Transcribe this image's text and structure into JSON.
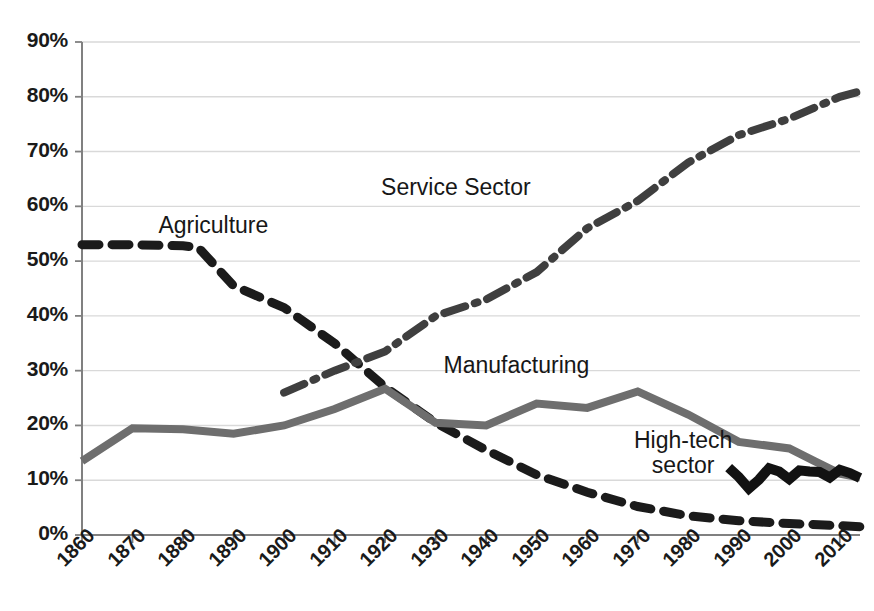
{
  "chart_data": {
    "type": "line",
    "title": "",
    "subtitle": "",
    "xlabel": "",
    "ylabel": "",
    "xlim": [
      1860,
      2014
    ],
    "ylim": [
      0,
      90
    ],
    "grid": true,
    "grid_axis": "y",
    "legend_position": "inline-annotations",
    "y_tick_labels": [
      "90%",
      "80%",
      "70%",
      "60%",
      "50%",
      "40%",
      "30%",
      "20%",
      "10%",
      "0%"
    ],
    "y_tick_values": [
      90,
      80,
      70,
      60,
      50,
      40,
      30,
      20,
      10,
      0
    ],
    "x_tick_labels": [
      "1860",
      "1870",
      "1880",
      "1890",
      "1900",
      "1910",
      "1920",
      "1930",
      "1940",
      "1950",
      "1960",
      "1970",
      "1980",
      "1990",
      "2000",
      "2010"
    ],
    "x_tick_values": [
      1860,
      1870,
      1880,
      1890,
      1900,
      1910,
      1920,
      1930,
      1940,
      1950,
      1960,
      1970,
      1980,
      1990,
      2000,
      2010
    ],
    "series": [
      {
        "name": "Agriculture",
        "label": "Agriculture",
        "color": "#1b1b1b",
        "linestyle": "dashed",
        "linewidth": 9,
        "dasharray": "17 13",
        "annotation_xy": [
          1886,
          56
        ],
        "x": [
          1860,
          1870,
          1880,
          1883,
          1890,
          1900,
          1910,
          1920,
          1930,
          1940,
          1950,
          1960,
          1970,
          1980,
          1990,
          2000,
          2010,
          2014
        ],
        "values": [
          53,
          53,
          52.8,
          52.5,
          45.5,
          41.5,
          35,
          27,
          20.5,
          15.5,
          11,
          7.8,
          5.2,
          3.5,
          2.6,
          2.1,
          1.7,
          1.5
        ]
      },
      {
        "name": "Manufacturing",
        "label": "Manufacturing",
        "color": "#6e6e6e",
        "linestyle": "solid",
        "linewidth": 8,
        "dasharray": "",
        "annotation_xy": [
          1946,
          30.5
        ],
        "x": [
          1860,
          1870,
          1880,
          1890,
          1900,
          1910,
          1920,
          1930,
          1940,
          1950,
          1960,
          1970,
          1980,
          1990,
          2000,
          2005,
          2010,
          2014
        ],
        "values": [
          13.5,
          19.5,
          19.3,
          18.5,
          20,
          23,
          26.7,
          20.5,
          20,
          24,
          23.2,
          26.2,
          22,
          17,
          15.8,
          13.5,
          11.2,
          10.5
        ]
      },
      {
        "name": "Service Sector",
        "label": "Service Sector",
        "color": "#3f3f3f",
        "linestyle": "dashdot",
        "linewidth": 8,
        "dasharray": "22 10 3 10",
        "annotation_xy": [
          1934,
          63
        ],
        "x": [
          1900,
          1910,
          1920,
          1930,
          1940,
          1950,
          1960,
          1970,
          1980,
          1990,
          2000,
          2010,
          2014
        ],
        "values": [
          26,
          30,
          33.5,
          40,
          43,
          48,
          56,
          61,
          68,
          73,
          76,
          80,
          81
        ]
      },
      {
        "name": "High-tech sector",
        "label": "High-tech\nsector",
        "label_line_1": "High-tech",
        "label_line_2": "sector",
        "color": "#121212",
        "linestyle": "solid",
        "linewidth": 10,
        "dasharray": "",
        "annotation_xy": [
          1979,
          14.5
        ],
        "x": [
          1988,
          1990,
          1992,
          1994,
          1996,
          1998,
          2000,
          2002,
          2004,
          2006,
          2008,
          2010,
          2012,
          2014
        ],
        "values": [
          12.3,
          10.6,
          8.5,
          10.1,
          12.2,
          11.6,
          10.2,
          11.8,
          11.6,
          11.5,
          10.5,
          11.9,
          11.3,
          10.4
        ]
      }
    ],
    "annotations": [
      {
        "text": "Agriculture",
        "x": 1886,
        "y": 56
      },
      {
        "text": "Service Sector",
        "x": 1934,
        "y": 63
      },
      {
        "text": "Manufacturing",
        "x": 1946,
        "y": 30.5
      },
      {
        "text": "High-tech sector",
        "x": 1979,
        "y": 14.5
      }
    ]
  },
  "axes": {
    "gridline_color": "#d9d9d9",
    "axis_color": "#808080",
    "tick_color": "#808080",
    "background": "#ffffff"
  }
}
